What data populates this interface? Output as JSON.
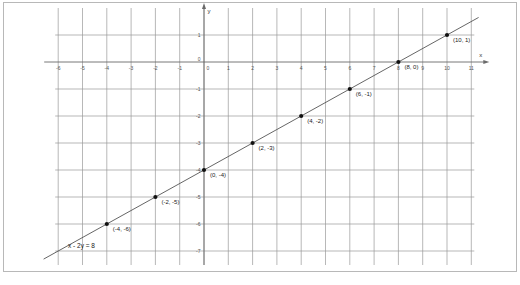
{
  "figure": {
    "background_color": "#ffffff",
    "border_color": "#b8b8b8",
    "grid_color": "#9a9a9a",
    "axis_color": "#6a6a6a",
    "line_color": "#555555",
    "point_color": "#111111"
  },
  "chart_data": {
    "type": "line",
    "title": "",
    "xlabel": "x",
    "ylabel": "y",
    "equation": "x − 2y = 8",
    "equation_label": "x - 2y = 8",
    "slope": 0.5,
    "y_intercept": -4,
    "grid": true,
    "legend": "none",
    "xlim": [
      -6,
      11
    ],
    "ylim": [
      -7,
      1
    ],
    "xticks": [
      -6,
      -5,
      -4,
      -3,
      -2,
      -1,
      0,
      1,
      2,
      3,
      4,
      5,
      6,
      7,
      8,
      9,
      10,
      11
    ],
    "yticks": [
      1,
      0,
      -1,
      -2,
      -3,
      -4,
      -5,
      -6,
      -7
    ],
    "xtick_labels": [
      "-6",
      "-5",
      "-4",
      "-3",
      "-2",
      "-1",
      "0",
      "1",
      "2",
      "3",
      "4",
      "5",
      "6",
      "7",
      "8",
      "9",
      "10",
      "11"
    ],
    "ytick_labels": [
      "1",
      "0",
      "-1",
      "-2",
      "-3",
      "-4",
      "-5",
      "-6",
      "-7"
    ],
    "x": [
      -4,
      -2,
      0,
      2,
      4,
      6,
      8,
      10
    ],
    "y": [
      -6,
      -5,
      -4,
      -3,
      -2,
      -1,
      0,
      1
    ],
    "points": [
      {
        "x": -4,
        "y": -6,
        "label": "(-4, -6)",
        "label_dx": 6,
        "label_dy": 7
      },
      {
        "x": -2,
        "y": -5,
        "label": "(-2, -5)",
        "label_dx": 6,
        "label_dy": 7
      },
      {
        "x": 0,
        "y": -4,
        "label": "(0, -4)",
        "label_dx": 6,
        "label_dy": 7
      },
      {
        "x": 2,
        "y": -3,
        "label": "(2, -3)",
        "label_dx": 6,
        "label_dy": 7
      },
      {
        "x": 4,
        "y": -2,
        "label": "(4, -2)",
        "label_dx": 6,
        "label_dy": 7
      },
      {
        "x": 6,
        "y": -1,
        "label": "(6, -1)",
        "label_dx": 6,
        "label_dy": 7
      },
      {
        "x": 8,
        "y": 0,
        "label": "(8, 0)",
        "label_dx": 6,
        "label_dy": 7
      },
      {
        "x": 10,
        "y": 1,
        "label": "(10, 1)",
        "label_dx": 6,
        "label_dy": 7
      }
    ],
    "axis_arrow_labels": {
      "x": "x",
      "y": "y"
    }
  }
}
